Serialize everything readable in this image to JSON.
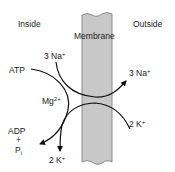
{
  "diagram": {
    "regions": {
      "inside": "Inside",
      "outside": "Outside",
      "membrane": "Membrane"
    },
    "species": {
      "atp": "ATP",
      "na_in": "3 Na",
      "na_in_sup": "+",
      "na_out": "3 Na",
      "na_out_sup": "+",
      "mg": "Mg",
      "mg_sup": "2+",
      "k_out": "2 K",
      "k_out_sup": "+",
      "k_in": "2 K",
      "k_in_sup": "+",
      "adp": "ADP",
      "plus": "+",
      "pi": "P",
      "pi_sub": "i"
    },
    "colors": {
      "membrane_fill": "#c8c8c8",
      "membrane_stroke": "#8a8a8a",
      "arrow": "#111111",
      "text": "#222222"
    }
  }
}
